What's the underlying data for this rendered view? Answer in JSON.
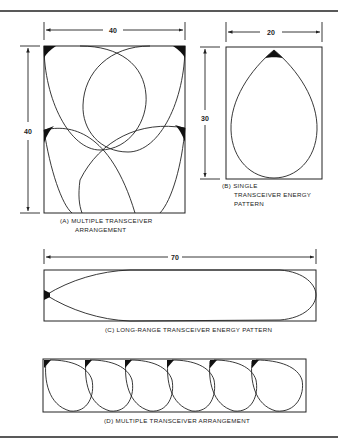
{
  "figures": [
    {
      "id": "A",
      "caption_line1": "(A) MULTIPLE TRANSCEIVER",
      "caption_line2": "ARRANGEMENT",
      "width_label": "40",
      "height_label": "40"
    },
    {
      "id": "B",
      "caption_line1": "(B) SINGLE",
      "caption_line2": "TRANSCEIVER ENERGY",
      "caption_line3": "PATTERN",
      "width_label": "20",
      "height_label": "30"
    },
    {
      "id": "C",
      "caption_line1": "(C) LONG-RANGE TRANSCEIVER ENERGY PATTERN",
      "width_label": "70"
    },
    {
      "id": "D",
      "caption_line1": "(D) MULTIPLE TRANSCEIVER ARRANGEMENT"
    }
  ],
  "colors": {
    "ink": "#222222",
    "background": "#ffffff"
  }
}
